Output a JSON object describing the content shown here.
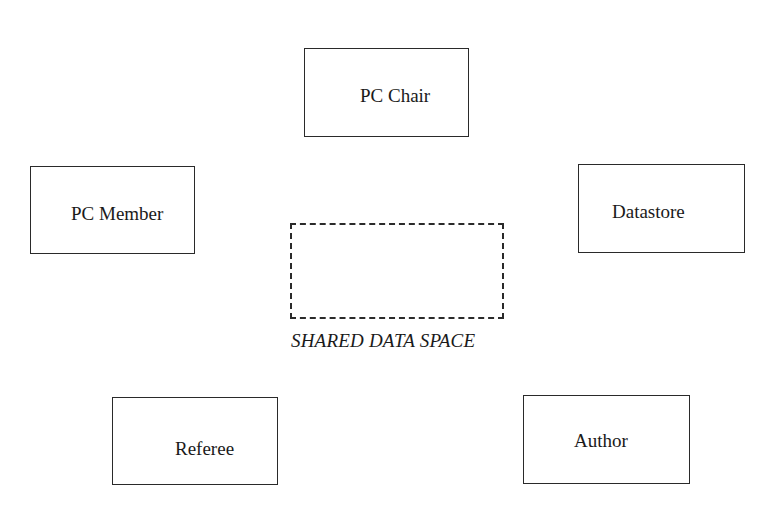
{
  "diagram": {
    "nodes": {
      "pc_chair": {
        "label": "PC Chair"
      },
      "pc_member": {
        "label": "PC Member"
      },
      "datastore": {
        "label": "Datastore"
      },
      "referee": {
        "label": "Referee"
      },
      "author": {
        "label": "Author"
      }
    },
    "shared_space": {
      "caption": "SHARED DATA SPACE"
    }
  }
}
